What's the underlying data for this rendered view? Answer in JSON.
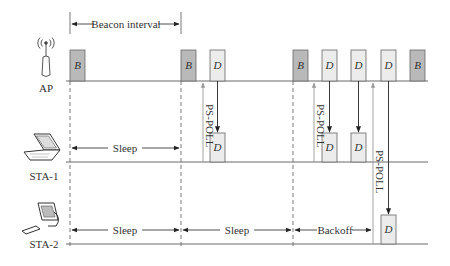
{
  "diagram": {
    "interval_label": "Beacon interval",
    "colors": {
      "beacon_fill": "#b9b9b9",
      "data_fill": "#ececec",
      "block_stroke": "#666666",
      "line": "#6a6a6a",
      "poll_arrow": "#999999"
    },
    "nodes": [
      {
        "id": "ap",
        "label": "AP",
        "icon": "antenna-icon"
      },
      {
        "id": "sta1",
        "label": "STA-1",
        "icon": "laptop-icon"
      },
      {
        "id": "sta2",
        "label": "STA-2",
        "icon": "desktop-computer-icon"
      }
    ],
    "ap_frames": [
      {
        "type": "B",
        "label": "B"
      },
      {
        "type": "B",
        "label": "B"
      },
      {
        "type": "D",
        "label": "D"
      },
      {
        "type": "B",
        "label": "B"
      },
      {
        "type": "D",
        "label": "D"
      },
      {
        "type": "D",
        "label": "D"
      },
      {
        "type": "D",
        "label": "D"
      },
      {
        "type": "B",
        "label": "B"
      }
    ],
    "sta1_frames": [
      {
        "type": "D",
        "label": "D"
      },
      {
        "type": "D",
        "label": "D"
      },
      {
        "type": "D",
        "label": "D"
      }
    ],
    "sta2_frames": [
      {
        "type": "D",
        "label": "D"
      }
    ],
    "intervals": {
      "sta1_sleep": "Sleep",
      "sta2_sleep_1": "Sleep",
      "sta2_sleep_2": "Sleep",
      "sta2_backoff": "Backoff"
    },
    "poll_labels": {
      "sta1_poll_1": "PS-POLL",
      "sta1_poll_2": "PS-POLL",
      "sta2_poll": "PS-POLL"
    }
  }
}
